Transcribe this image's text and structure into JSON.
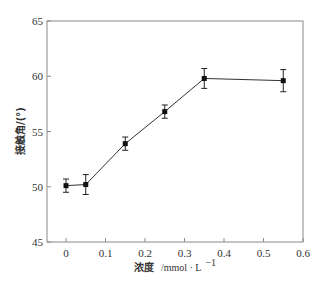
{
  "chart_data": {
    "type": "line",
    "title": "",
    "xlabel": "浓度 /mmol·L⁻¹",
    "xlabel_prefix": "浓度",
    "xlabel_unit": "/mmol · L",
    "xlabel_sup": "−1",
    "ylabel": "接触角/(°)",
    "xlim": [
      0,
      0.6
    ],
    "ylim": [
      45,
      65
    ],
    "xticks": [
      "0",
      "0.1",
      "0.2",
      "0.3",
      "0.4",
      "0.5",
      "0.6"
    ],
    "yticks": [
      "45",
      "50",
      "55",
      "60",
      "65"
    ],
    "grid": false,
    "legend": null,
    "series": [
      {
        "name": "接触角",
        "x": [
          0,
          0.05,
          0.15,
          0.25,
          0.35,
          0.55
        ],
        "values": [
          50.1,
          50.2,
          53.9,
          56.8,
          59.8,
          59.6
        ],
        "error": [
          0.6,
          0.9,
          0.6,
          0.6,
          0.9,
          1.0
        ],
        "marker": "square",
        "color": "#111111"
      }
    ]
  }
}
